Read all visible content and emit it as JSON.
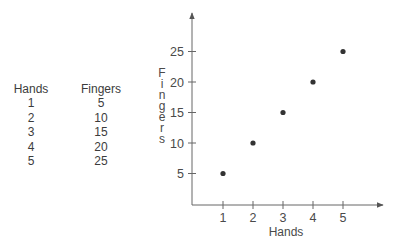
{
  "table": {
    "headers": [
      "Hands",
      "Fingers"
    ],
    "rows": [
      [
        "1",
        "5"
      ],
      [
        "2",
        "10"
      ],
      [
        "3",
        "15"
      ],
      [
        "4",
        "20"
      ],
      [
        "5",
        "25"
      ]
    ]
  },
  "chart_data": {
    "type": "scatter",
    "title": "",
    "xlabel": "Hands",
    "ylabel": "Fingers",
    "x": [
      1,
      2,
      3,
      4,
      5
    ],
    "y": [
      5,
      10,
      15,
      20,
      25
    ],
    "x_ticks": [
      "1",
      "2",
      "3",
      "4",
      "5"
    ],
    "y_ticks": [
      "5",
      "10",
      "15",
      "20",
      "25"
    ],
    "xlim": [
      0,
      5.5
    ],
    "ylim": [
      0,
      28
    ],
    "grid": false,
    "legend": null,
    "point_color": "#333333",
    "axis_color": "#555555"
  }
}
